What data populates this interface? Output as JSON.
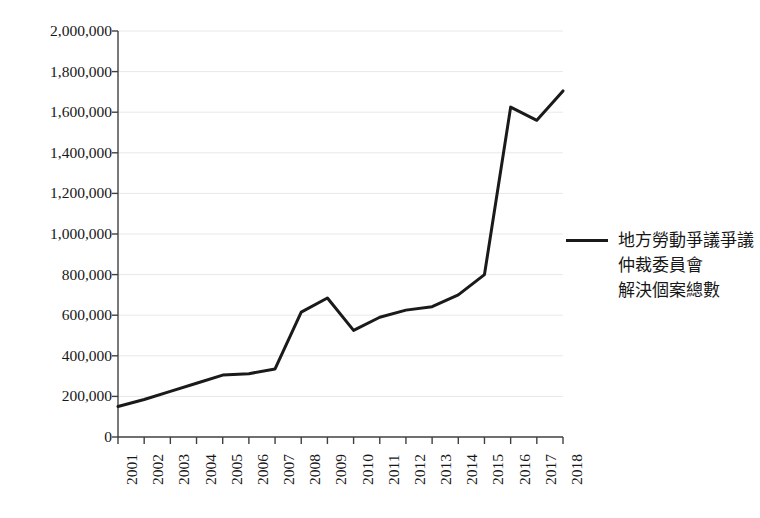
{
  "chart_data": {
    "type": "line",
    "title": "",
    "subtitle": "",
    "xlabel": "",
    "ylabel": "",
    "grid": true,
    "legend_position": "right",
    "xlim": [
      "2001",
      "2018"
    ],
    "ylim": [
      0,
      2000000
    ],
    "categories": [
      "2001",
      "2002",
      "2003",
      "2004",
      "2005",
      "2006",
      "2007",
      "2008",
      "2009",
      "2010",
      "2011",
      "2012",
      "2013",
      "2014",
      "2015",
      "2016",
      "2017",
      "2018"
    ],
    "x_tick_labels": [
      "2001",
      "2002",
      "2003",
      "2004",
      "2005",
      "2006",
      "2007",
      "2008",
      "2009",
      "2010",
      "2011",
      "2012",
      "2013",
      "2014",
      "2015",
      "2016",
      "2017",
      "2018"
    ],
    "y_tick_labels": [
      "0",
      "200,000",
      "400,000",
      "600,000",
      "800,000",
      "1,000,000",
      "1,200,000",
      "1,400,000",
      "1,600,000",
      "1,800,000",
      "2,000,000"
    ],
    "y_tick_values": [
      0,
      200000,
      400000,
      600000,
      800000,
      1000000,
      1200000,
      1400000,
      1600000,
      1800000,
      2000000
    ],
    "series": [
      {
        "name": "地方勞動爭議仲裁委員會解決個案總數",
        "color": "#1a1a1a",
        "values": [
          150000,
          185000,
          225000,
          265000,
          305000,
          312000,
          335000,
          615000,
          685000,
          525000,
          590000,
          625000,
          642000,
          700000,
          800000,
          1625000,
          1560000,
          1705000
        ]
      }
    ]
  },
  "legend": {
    "series_label_lines": [
      "地方勞動爭議爭議",
      "仲裁委員會",
      "解決個案總數"
    ],
    "line_color": "#1a1a1a"
  },
  "axes": {
    "grid_color": "#e8e8e8",
    "axis_color": "#404040"
  }
}
